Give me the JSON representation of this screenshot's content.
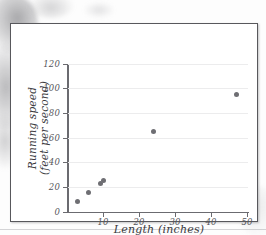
{
  "figure": {
    "kind": "scatter-plot-figure"
  },
  "chart_data": {
    "type": "scatter",
    "title": "",
    "xlabel": "Length (inches)",
    "ylabel_line1": "Running speed",
    "ylabel_line2": "(feet per second)",
    "ylabel": "Running speed (feet per second)",
    "xlim": [
      0,
      50
    ],
    "ylim": [
      0,
      120
    ],
    "xticks": [
      10,
      20,
      30,
      40,
      50
    ],
    "xtick_labels": [
      "10",
      "20",
      "30",
      "40",
      "50"
    ],
    "yticks": [
      0,
      20,
      40,
      60,
      80,
      100,
      120
    ],
    "ytick_labels": [
      "0",
      "20",
      "40",
      "60",
      "80",
      "100",
      "120"
    ],
    "grid": "horizontal",
    "legend": "none",
    "marker_color": "#6e6e73",
    "axis_color": "#6b6b70",
    "gridline_color": "#ececed",
    "points": [
      {
        "x": 3.0,
        "y": 8
      },
      {
        "x": 6.0,
        "y": 15.5
      },
      {
        "x": 9.3,
        "y": 23
      },
      {
        "x": 10.0,
        "y": 25
      },
      {
        "x": 24.0,
        "y": 65
      },
      {
        "x": 47.0,
        "y": 95
      }
    ]
  }
}
